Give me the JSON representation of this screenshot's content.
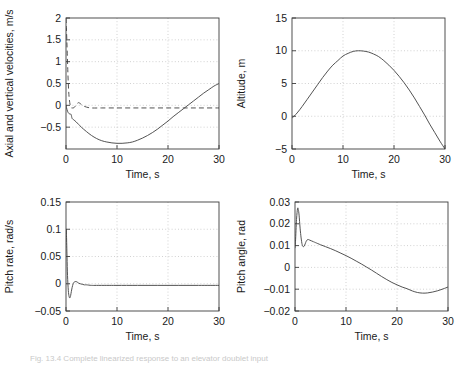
{
  "figure": {
    "caption": "Fig. 13.4 Complete linearized response to an elevator doublet input"
  },
  "chart_data": [
    {
      "id": "axial_vertical_velocities",
      "type": "line",
      "title": "",
      "xlabel": "Time, s",
      "ylabel": "Axial and vertical velocities, m/s",
      "xlim": [
        0,
        30
      ],
      "ylim": [
        -1,
        2
      ],
      "xticks": [
        0,
        10,
        20,
        30
      ],
      "xticklabels": [
        "0",
        "10",
        "20",
        "30"
      ],
      "yticks": [
        -0.5,
        0,
        0.5,
        1,
        1.5,
        2
      ],
      "yticklabels": [
        "-0.5",
        "0",
        "0.5",
        "1",
        "1.5",
        "2"
      ],
      "grid": true,
      "legend": "none",
      "series": [
        {
          "name": "axial velocity",
          "style": "solid",
          "x": [
            0,
            0.2,
            0.4,
            0.6,
            0.8,
            1,
            1.2,
            1.5,
            2,
            2.5,
            3,
            4,
            5,
            6,
            7,
            8,
            9,
            10,
            11,
            12,
            13,
            14,
            15,
            16,
            17,
            18,
            19,
            20,
            21,
            22,
            23,
            24,
            25,
            26,
            27,
            28,
            29,
            30
          ],
          "y": [
            0,
            -0.1,
            -0.16,
            -0.19,
            -0.2,
            -0.21,
            -0.3,
            -0.33,
            -0.38,
            -0.44,
            -0.5,
            -0.6,
            -0.69,
            -0.76,
            -0.81,
            -0.84,
            -0.86,
            -0.87,
            -0.87,
            -0.86,
            -0.84,
            -0.8,
            -0.75,
            -0.69,
            -0.62,
            -0.54,
            -0.45,
            -0.36,
            -0.26,
            -0.17,
            -0.08,
            0.01,
            0.1,
            0.19,
            0.28,
            0.36,
            0.44,
            0.5
          ]
        },
        {
          "name": "vertical velocity",
          "style": "dashed",
          "x": [
            0,
            0.08,
            0.16,
            0.25,
            0.35,
            0.45,
            0.6,
            0.8,
            1,
            1.1,
            1.3,
            1.6,
            2,
            2.4,
            2.8,
            3.2,
            4,
            5,
            7,
            10,
            13,
            16,
            20,
            24,
            27,
            30
          ],
          "y": [
            2,
            1.78,
            1.5,
            1.18,
            0.82,
            0.5,
            0.2,
            0.02,
            -0.04,
            -0.06,
            -0.06,
            -0.05,
            0.01,
            0.06,
            0.04,
            0.0,
            -0.04,
            -0.06,
            -0.06,
            -0.06,
            -0.06,
            -0.06,
            -0.06,
            -0.06,
            -0.06,
            -0.06
          ]
        }
      ]
    },
    {
      "id": "altitude",
      "type": "line",
      "title": "",
      "xlabel": "Time, s",
      "ylabel": "Altitude, m",
      "xlim": [
        0,
        30
      ],
      "ylim": [
        -5,
        15
      ],
      "xticks": [
        0,
        10,
        20,
        30
      ],
      "xticklabels": [
        "0",
        "10",
        "20",
        "30"
      ],
      "yticks": [
        -5,
        0,
        5,
        10,
        15
      ],
      "yticklabels": [
        "-5",
        "0",
        "5",
        "10",
        "15"
      ],
      "grid": true,
      "legend": "none",
      "series": [
        {
          "name": "altitude",
          "style": "solid",
          "x": [
            0,
            1,
            2,
            3,
            4,
            5,
            6,
            7,
            8,
            9,
            10,
            11,
            12,
            13,
            14,
            15,
            16,
            17,
            18,
            19,
            20,
            21,
            22,
            23,
            24,
            25,
            26,
            27,
            28,
            29,
            30
          ],
          "y": [
            -0.3,
            0.5,
            1.5,
            2.6,
            3.7,
            4.8,
            5.9,
            6.9,
            7.8,
            8.5,
            9.2,
            9.6,
            9.9,
            10.0,
            9.95,
            9.8,
            9.5,
            9.1,
            8.5,
            7.8,
            7.0,
            6.1,
            5.1,
            4.0,
            2.8,
            1.5,
            0.2,
            -1.2,
            -2.5,
            -3.8,
            -5.0
          ]
        }
      ]
    },
    {
      "id": "pitch_rate",
      "type": "line",
      "title": "",
      "xlabel": "Time, s",
      "ylabel": "Pitch rate, rad/s",
      "xlim": [
        0,
        30
      ],
      "ylim": [
        -0.05,
        0.15
      ],
      "xticks": [
        0,
        10,
        20,
        30
      ],
      "xticklabels": [
        "0",
        "10",
        "20",
        "30"
      ],
      "yticks": [
        -0.05,
        0,
        0.05,
        0.1,
        0.15
      ],
      "yticklabels": [
        "-0.05",
        "0",
        "0.05",
        "0.1",
        "0.15"
      ],
      "grid": true,
      "legend": "none",
      "series": [
        {
          "name": "pitch rate",
          "style": "solid",
          "x": [
            0,
            0.05,
            0.1,
            0.2,
            0.3,
            0.45,
            0.6,
            0.75,
            0.9,
            1.05,
            1.2,
            1.4,
            1.6,
            1.8,
            2,
            2.2,
            2.5,
            2.8,
            3.2,
            3.6,
            4,
            5,
            6,
            8,
            10,
            14,
            18,
            22,
            26,
            30
          ],
          "y": [
            0.095,
            0.1,
            0.088,
            0.05,
            0.015,
            -0.012,
            -0.023,
            -0.026,
            -0.022,
            -0.014,
            -0.007,
            0.0,
            0.003,
            0.004,
            0.004,
            0.003,
            0.001,
            0.0,
            -0.001,
            -0.002,
            -0.002,
            -0.003,
            -0.003,
            -0.003,
            -0.003,
            -0.003,
            -0.003,
            -0.003,
            -0.003,
            -0.003
          ]
        }
      ]
    },
    {
      "id": "pitch_angle",
      "type": "line",
      "title": "",
      "xlabel": "Time, s",
      "ylabel": "Pitch angle, rad",
      "xlim": [
        0,
        30
      ],
      "ylim": [
        -0.02,
        0.03
      ],
      "xticks": [
        0,
        10,
        20,
        30
      ],
      "xticklabels": [
        "0",
        "10",
        "20",
        "30"
      ],
      "yticks": [
        -0.02,
        -0.01,
        0,
        0.01,
        0.02,
        0.03
      ],
      "yticklabels": [
        "-0.02",
        "-0.01",
        "0",
        "0.01",
        "0.02",
        "0.03"
      ],
      "grid": true,
      "legend": "none",
      "series": [
        {
          "name": "pitch angle",
          "style": "solid",
          "x": [
            0,
            0.1,
            0.3,
            0.5,
            0.65,
            0.8,
            1,
            1.2,
            1.4,
            1.6,
            1.8,
            2,
            2.2,
            2.5,
            2.8,
            3.2,
            3.6,
            4,
            5,
            6,
            7,
            8,
            9,
            10,
            11,
            12,
            13,
            14,
            15,
            16,
            17,
            18,
            19,
            20,
            21,
            22,
            23,
            24,
            25,
            26,
            27,
            28,
            29,
            30
          ],
          "y": [
            0.009,
            0.012,
            0.022,
            0.027,
            0.0265,
            0.024,
            0.018,
            0.0135,
            0.0105,
            0.0095,
            0.0098,
            0.0108,
            0.012,
            0.0128,
            0.0126,
            0.0122,
            0.0118,
            0.0114,
            0.0104,
            0.0095,
            0.0086,
            0.0076,
            0.0065,
            0.0054,
            0.0042,
            0.0029,
            0.0016,
            0.0002,
            -0.0012,
            -0.0027,
            -0.0042,
            -0.0056,
            -0.0069,
            -0.008,
            -0.009,
            -0.0098,
            -0.0108,
            -0.0115,
            -0.0118,
            -0.0117,
            -0.0113,
            -0.0107,
            -0.0099,
            -0.009
          ]
        }
      ]
    }
  ]
}
